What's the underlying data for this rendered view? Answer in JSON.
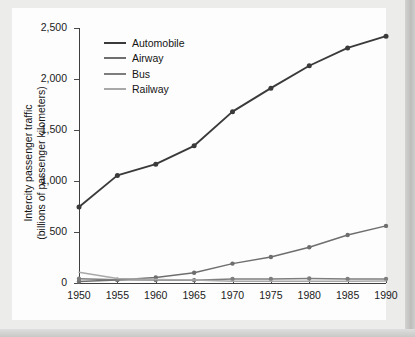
{
  "chart_data": {
    "type": "line",
    "title": "",
    "xlabel": "",
    "ylabel_line1": "Intercity passenger traffic",
    "ylabel_line2": "(billions of passenger kilometers)",
    "x": [
      1950,
      1955,
      1960,
      1965,
      1970,
      1975,
      1980,
      1985,
      1990
    ],
    "xticklabels": [
      "1950",
      "1955",
      "1960",
      "1965",
      "1970",
      "1975",
      "1980",
      "1985",
      "1990"
    ],
    "yticklabels": [
      "0",
      "500",
      "1,000",
      "1,500",
      "2,000",
      "2,500"
    ],
    "yticks": [
      0,
      500,
      1000,
      1500,
      2000,
      2500
    ],
    "xlim": [
      1950,
      1990
    ],
    "ylim": [
      0,
      2500
    ],
    "grid": false,
    "legend_position": "upper-left-inside",
    "series": [
      {
        "name": "Automobile",
        "color": "#3a3a3a",
        "markers": true,
        "values": [
          745,
          1055,
          1165,
          1345,
          1680,
          1910,
          2130,
          2305,
          2420
        ]
      },
      {
        "name": "Airway",
        "color": "#6e6e6e",
        "markers": true,
        "values": [
          15,
          30,
          55,
          100,
          190,
          255,
          350,
          470,
          560
        ]
      },
      {
        "name": "Bus",
        "color": "#7d7d7d",
        "markers": true,
        "values": [
          42,
          33,
          30,
          28,
          40,
          40,
          44,
          40,
          40
        ]
      },
      {
        "name": "Railway",
        "color": "#a8a8a8",
        "markers": false,
        "values": [
          105,
          45,
          34,
          30,
          18,
          16,
          17,
          18,
          20
        ]
      }
    ]
  },
  "legend": {
    "items": [
      {
        "label": "Automobile",
        "color": "#3a3a3a",
        "width": "2.6px"
      },
      {
        "label": "Airway",
        "color": "#6e6e6e",
        "width": "2.2px"
      },
      {
        "label": "Bus",
        "color": "#7d7d7d",
        "width": "2.2px"
      },
      {
        "label": "Railway",
        "color": "#a8a8a8",
        "width": "2.2px"
      }
    ]
  }
}
